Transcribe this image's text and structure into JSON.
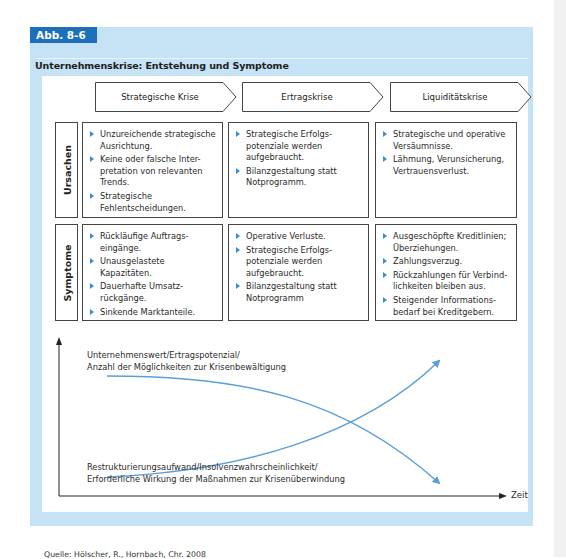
{
  "figure": {
    "tab_label": "Abb. 8-6",
    "title": "Unternehmenskrise: Entstehung und Symptome",
    "source": "Quelle: Hölscher, R., Hornbach, Chr. 2008"
  },
  "phases": [
    {
      "label": "Strategische Krise"
    },
    {
      "label": "Ertragskrise"
    },
    {
      "label": "Liquiditätskrise"
    }
  ],
  "rows": [
    {
      "label": "Ursachen",
      "cells": [
        {
          "items": [
            "Unzureichende strategische Ausrichtung.",
            "Keine oder falsche Inter-pretation von relevanten Trends.",
            "Strategische Fehlentscheidungen."
          ]
        },
        {
          "items": [
            "Strategische Erfolgs-potenziale werden aufgebraucht.",
            "Bilanzgestaltung statt Notprogramm."
          ]
        },
        {
          "items": [
            "Strategische und operative Versäumnisse.",
            "Lähmung, Verunsicherung, Vertrauensverlust."
          ]
        }
      ]
    },
    {
      "label": "Symptome",
      "cells": [
        {
          "items": [
            "Rückläufige Auftrags-eingänge.",
            "Unausgelastete Kapazitäten.",
            "Dauerhafte Umsatz-rückgänge.",
            "Sinkende Marktanteile."
          ]
        },
        {
          "items": [
            "Operative Verluste.",
            "Strategische Erfolgs-potenziale werden aufgebraucht.",
            "Bilanzgestaltung statt Notprogramm"
          ]
        },
        {
          "items": [
            "Ausgeschöpfte Kreditlinien; Überziehungen.",
            "Zahlungsverzug.",
            "Rückzahlungen für Verbind-lichkeiten bleiben aus.",
            "Steigender Informations-bedarf bei Kreditgebern."
          ]
        }
      ]
    }
  ],
  "graph": {
    "x_axis_label": "Zeit",
    "curve_decreasing": {
      "line1": "Unternehmenswert/Ertragspotenzial/",
      "line2": "Anzahl der Möglichkeiten zur Krisenbewältigung"
    },
    "curve_increasing": {
      "line1": "Restrukturierungsaufwand/Insolvenzwahrscheinlichkeit/",
      "line2": "Erforderliche Wirkung der Maßnahmen zur Krisenüberwindung"
    },
    "curve_color": "#5b9fd6"
  },
  "colors": {
    "panel_bg": "#c6e2f5",
    "tab_bg": "#1c6fb8",
    "bullet": "#3a8fd1"
  }
}
